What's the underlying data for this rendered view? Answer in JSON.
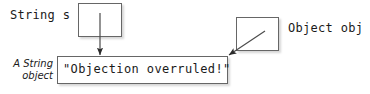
{
  "diagram": {
    "background_color": "#ffffff",
    "line_color": "#666666",
    "text_color": "#1a1a1a",
    "boxes": [
      {
        "name": "string-s-reference-box",
        "label": "String s",
        "content": ""
      },
      {
        "name": "object-obj-reference-box",
        "label": "Object obj",
        "content": ""
      },
      {
        "name": "string-object-box",
        "content": "\"Objection overruled!\""
      }
    ],
    "labels": {
      "string_s": "String s",
      "object_obj": "Object obj",
      "string_value": "\"Objection overruled!\"",
      "annotation_line1": "A String",
      "annotation_line2": "object"
    },
    "arrows": [
      {
        "name": "arrow-string-s-to-object",
        "from": "string-s-reference-box",
        "to": "string-object-box",
        "direction": "down"
      },
      {
        "name": "arrow-object-obj-to-object",
        "from": "object-obj-reference-box",
        "to": "string-object-box",
        "direction": "down-left"
      }
    ]
  }
}
